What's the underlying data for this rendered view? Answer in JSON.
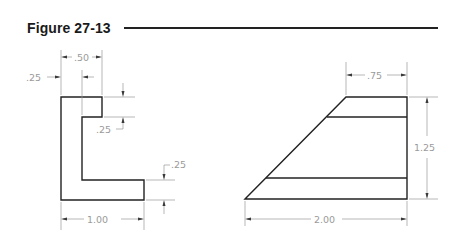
{
  "figure": {
    "title": "Figure 27-13"
  },
  "left_view": {
    "description": "L-shaped profile with notch",
    "dimensions": {
      "top_width": ".50",
      "left_offset": ".25",
      "notch_depth": ".25",
      "base_thickness": ".25",
      "overall_width": "1.00"
    }
  },
  "right_view": {
    "description": "Trapezoidal profile with two horizontal lines",
    "dimensions": {
      "top_width": ".75",
      "overall_height": "1.25",
      "overall_width": "2.00"
    }
  },
  "colors": {
    "object_line": "#222222",
    "dimension_line": "#9a9a9a"
  }
}
